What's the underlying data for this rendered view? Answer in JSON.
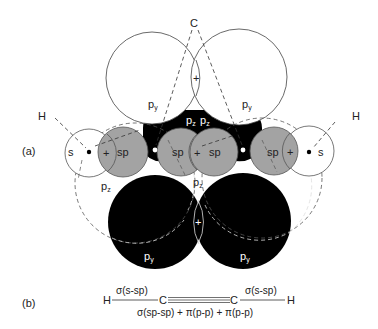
{
  "figure": {
    "panel_a_label": "(a)",
    "panel_b_label": "(b)",
    "colors": {
      "background": "#ffffff",
      "outline": "#444444",
      "sp_fill": "#a3a3a3",
      "p_fill_dark": "#000000",
      "dashed": "#555555"
    },
    "panel_a": {
      "atom_labels": {
        "carbon": "C",
        "hydrogen_left": "H",
        "hydrogen_right": "H"
      },
      "orbitals": {
        "py_top_left": {
          "base": "p",
          "sub": "y"
        },
        "py_top_right": {
          "base": "p",
          "sub": "y"
        },
        "pz_center_left": {
          "base": "p",
          "sub": "z"
        },
        "pz_center_right": {
          "base": "p",
          "sub": "z"
        },
        "s_left": "s",
        "sp_left": "sp",
        "sp_center_left": "sp",
        "sp_center_right": "sp",
        "sp_right": "sp",
        "s_right": "s",
        "pz_lower_left": {
          "base": "p",
          "sub": "z"
        },
        "pz_lower_center": {
          "base": "p",
          "sub": "z"
        },
        "py_bottom_left": {
          "base": "p",
          "sub": "y"
        },
        "py_bottom_right": {
          "base": "p",
          "sub": "y"
        }
      },
      "overlap_sign": "+"
    },
    "panel_b": {
      "h_left": "H",
      "c_left": "C",
      "c_right": "C",
      "h_right": "H",
      "sigma_left": "σ(s-sp)",
      "sigma_right": "σ(s-sp)",
      "triple_bond": "σ(sp-sp) + π(p-p) + π(p-p)"
    }
  }
}
